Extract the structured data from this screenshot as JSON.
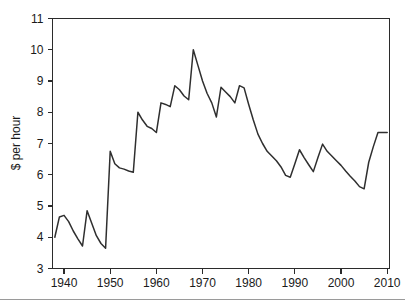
{
  "chart_data": {
    "type": "line",
    "title": "",
    "subtitle": "",
    "xlabel": "",
    "ylabel": "$ per hour",
    "xlim": [
      1937.5,
      2010.5
    ],
    "ylim": [
      3,
      11
    ],
    "grid": false,
    "legend": null,
    "x_ticks": [
      1940,
      1950,
      1960,
      1970,
      1980,
      1990,
      2000,
      2010
    ],
    "x_tick_labels": [
      "1940",
      "1950",
      "1960",
      "1970",
      "1980",
      "1990",
      "2000",
      "2010"
    ],
    "y_ticks": [
      3,
      4,
      5,
      6,
      7,
      8,
      9,
      10,
      11
    ],
    "y_tick_labels": [
      "3",
      "4",
      "5",
      "6",
      "7",
      "8",
      "9",
      "10",
      "11"
    ],
    "series": [
      {
        "name": "Real minimum wage",
        "color": "#2f2f2f",
        "x": [
          1938,
          1939,
          1940,
          1941,
          1942,
          1943,
          1944,
          1945,
          1946,
          1947,
          1948,
          1949,
          1950,
          1951,
          1952,
          1953,
          1954,
          1955,
          1956,
          1957,
          1958,
          1959,
          1960,
          1961,
          1962,
          1963,
          1964,
          1965,
          1966,
          1967,
          1968,
          1969,
          1970,
          1971,
          1972,
          1973,
          1974,
          1975,
          1976,
          1977,
          1978,
          1979,
          1980,
          1981,
          1982,
          1983,
          1984,
          1985,
          1986,
          1987,
          1988,
          1989,
          1990,
          1991,
          1992,
          1993,
          1994,
          1995,
          1996,
          1997,
          1998,
          1999,
          2000,
          2001,
          2002,
          2003,
          2004,
          2005,
          2006,
          2007,
          2008,
          2009,
          2010
        ],
        "y": [
          4.0,
          4.65,
          4.7,
          4.5,
          4.2,
          3.95,
          3.72,
          4.85,
          4.45,
          4.05,
          3.8,
          3.65,
          6.75,
          6.35,
          6.22,
          6.18,
          6.12,
          6.08,
          8.0,
          7.75,
          7.55,
          7.48,
          7.35,
          8.3,
          8.25,
          8.18,
          8.85,
          8.72,
          8.52,
          8.4,
          10.0,
          9.5,
          9.0,
          8.6,
          8.3,
          7.85,
          8.8,
          8.65,
          8.5,
          8.3,
          8.85,
          8.78,
          8.25,
          7.75,
          7.3,
          7.0,
          6.75,
          6.6,
          6.45,
          6.25,
          5.98,
          5.92,
          6.35,
          6.8,
          6.55,
          6.32,
          6.1,
          6.55,
          6.98,
          6.75,
          6.6,
          6.45,
          6.3,
          6.12,
          5.95,
          5.8,
          5.62,
          5.55,
          6.4,
          6.9,
          7.35,
          7.35,
          7.35
        ]
      }
    ]
  }
}
